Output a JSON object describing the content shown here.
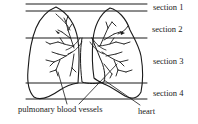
{
  "diagram": {
    "sections": [
      {
        "label": "section 1"
      },
      {
        "label": "section 2"
      },
      {
        "label": "section 3"
      },
      {
        "label": "section 4"
      }
    ],
    "annotations": {
      "vessels": "pulmonary blood vessels",
      "heart": "heart"
    },
    "colors": {
      "line": "#1a1a1a",
      "background": "#ffffff"
    }
  }
}
